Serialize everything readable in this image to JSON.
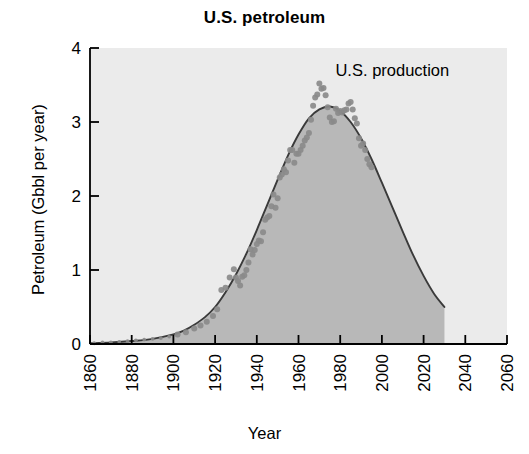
{
  "chart_data": {
    "type": "area",
    "title": "U.S. petroleum",
    "xlabel": "Year",
    "ylabel": "Petroleum (Gbbl per year)",
    "xlim": [
      1860,
      2060
    ],
    "ylim": [
      0,
      4
    ],
    "grid": false,
    "legend_position": "none",
    "annotations": [
      {
        "text": "U.S. production",
        "x": 2005,
        "y": 3.62
      }
    ],
    "xticks": [
      1860,
      1880,
      1900,
      1920,
      1940,
      1960,
      1980,
      2000,
      2020,
      2040,
      2060
    ],
    "xtick_labels": [
      "1860",
      "1880",
      "1900",
      "1920",
      "1940",
      "1960",
      "1980",
      "2000",
      "2020",
      "2040",
      "2060"
    ],
    "yticks": [
      0,
      1,
      2,
      3,
      4
    ],
    "ytick_labels": [
      "0",
      "1",
      "2",
      "3",
      "4"
    ],
    "colors": {
      "plot_background": "#ebebeb",
      "area_fill": "#b8b8b8",
      "curve_line": "#3a3a3a",
      "scatter_points": "#8a8a8a",
      "axis": "#000000",
      "text": "#000000",
      "page_background": "#ffffff"
    },
    "series": [
      {
        "name": "Hubbert curve fit",
        "type": "line",
        "style": "smooth-filled",
        "x": [
          1860,
          1870,
          1880,
          1890,
          1900,
          1905,
          1910,
          1915,
          1920,
          1925,
          1930,
          1935,
          1940,
          1945,
          1950,
          1955,
          1960,
          1965,
          1970,
          1975,
          1980,
          1985,
          1990,
          1995,
          2000,
          2005,
          2010,
          2015,
          2020,
          2025,
          2030
        ],
        "values": [
          0.01,
          0.02,
          0.04,
          0.07,
          0.13,
          0.18,
          0.26,
          0.36,
          0.5,
          0.7,
          0.94,
          1.22,
          1.54,
          1.88,
          2.22,
          2.55,
          2.83,
          3.05,
          3.17,
          3.21,
          3.15,
          3.0,
          2.78,
          2.5,
          2.18,
          1.85,
          1.52,
          1.2,
          0.92,
          0.68,
          0.5
        ]
      },
      {
        "name": "U.S. production (observed)",
        "type": "scatter",
        "x": [
          1862,
          1866,
          1870,
          1874,
          1878,
          1882,
          1886,
          1890,
          1894,
          1898,
          1902,
          1906,
          1910,
          1913,
          1916,
          1919,
          1921,
          1923,
          1925,
          1927,
          1929,
          1930,
          1931,
          1932,
          1933,
          1934,
          1935,
          1936,
          1937,
          1938,
          1939,
          1940,
          1941,
          1942,
          1943,
          1944,
          1945,
          1946,
          1947,
          1948,
          1949,
          1950,
          1951,
          1952,
          1953,
          1954,
          1955,
          1956,
          1957,
          1958,
          1959,
          1960,
          1961,
          1962,
          1963,
          1964,
          1965,
          1966,
          1967,
          1968,
          1969,
          1970,
          1971,
          1972,
          1973,
          1974,
          1975,
          1976,
          1977,
          1978,
          1979,
          1980,
          1981,
          1982,
          1983,
          1984,
          1985,
          1986,
          1987,
          1988,
          1989,
          1990,
          1991,
          1992,
          1993,
          1994,
          1995
        ],
        "values": [
          0.01,
          0.02,
          0.02,
          0.03,
          0.04,
          0.05,
          0.06,
          0.07,
          0.08,
          0.1,
          0.13,
          0.16,
          0.21,
          0.25,
          0.3,
          0.38,
          0.47,
          0.73,
          0.76,
          0.9,
          1.01,
          0.9,
          0.85,
          0.79,
          0.91,
          0.93,
          1.0,
          1.1,
          1.28,
          1.21,
          1.27,
          1.35,
          1.4,
          1.39,
          1.51,
          1.68,
          1.71,
          1.73,
          1.86,
          2.02,
          1.84,
          1.97,
          2.25,
          2.29,
          2.36,
          2.32,
          2.48,
          2.62,
          2.62,
          2.45,
          2.57,
          2.57,
          2.62,
          2.68,
          2.75,
          2.79,
          2.85,
          3.03,
          3.22,
          3.33,
          3.37,
          3.52,
          3.45,
          3.46,
          3.36,
          3.2,
          3.06,
          3.0,
          3.01,
          3.18,
          3.12,
          3.15,
          3.13,
          3.16,
          3.17,
          3.25,
          3.27,
          3.17,
          3.05,
          2.98,
          2.78,
          2.68,
          2.71,
          2.62,
          2.5,
          2.43,
          2.39
        ]
      }
    ]
  },
  "figure": {
    "title": "U.S. petroleum",
    "x_axis_title": "Year",
    "y_axis_title": "Petroleum (Gbbl per year)",
    "annotation_production": "U.S. production"
  }
}
